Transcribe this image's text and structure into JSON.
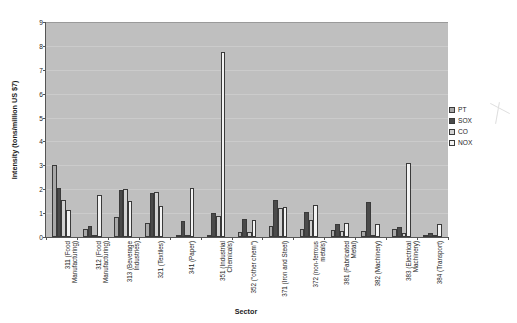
{
  "chart_data": {
    "type": "bar",
    "title": "",
    "xlabel": "Sector",
    "ylabel": "Intensity (tons/million US $7)",
    "ylim": [
      0,
      9
    ],
    "ytick_values": [
      0,
      1,
      2,
      3,
      4,
      5,
      6,
      7,
      8,
      9
    ],
    "grid": true,
    "legend_position": "right",
    "categories": [
      "311 (Food Manufacturing)",
      "312 (Food Manufacturing)",
      "313 (Beverage Industries)",
      "321 (Textiles)",
      "341 (Paper)",
      "351 (Industrial Chemicals)",
      "352 (\"other chem\")",
      "371 (Iron and Steel)",
      "372 (non-ferrous metals)",
      "381 (Fabricated Metal)",
      "382 (Machinery)",
      "383 (Electrical Machinery)",
      "384 (Transport)"
    ],
    "series": [
      {
        "name": "PT",
        "color": "#a8a8a8",
        "values": [
          3.0,
          0.35,
          0.85,
          0.6,
          0.0,
          0.1,
          0.2,
          0.45,
          0.35,
          0.3,
          0.25,
          0.35,
          0.1
        ]
      },
      {
        "name": "SOX",
        "color": "#4a4a4a",
        "values": [
          2.05,
          0.45,
          1.95,
          1.85,
          0.65,
          1.0,
          0.75,
          1.55,
          1.05,
          0.55,
          1.45,
          0.4,
          0.15
        ]
      },
      {
        "name": "CO",
        "color": "#d2d2d2",
        "values": [
          1.55,
          0.1,
          2.0,
          1.9,
          0.05,
          0.9,
          0.2,
          1.2,
          0.7,
          0.25,
          0.1,
          0.15,
          0.05
        ]
      },
      {
        "name": "NOX",
        "color": "#f4f4f4",
        "values": [
          1.15,
          1.75,
          1.5,
          1.3,
          2.05,
          7.75,
          0.7,
          1.25,
          1.35,
          0.6,
          0.55,
          3.1,
          0.55
        ]
      }
    ]
  },
  "legend": {
    "entries": [
      {
        "label": "PT"
      },
      {
        "label": "SOX"
      },
      {
        "label": "CO"
      },
      {
        "label": "NOX"
      }
    ]
  }
}
